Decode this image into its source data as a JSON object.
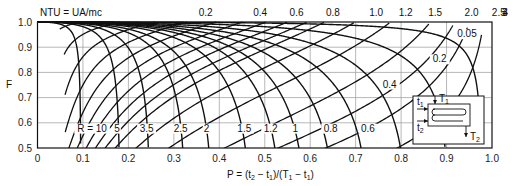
{
  "chart_data": {
    "type": "line",
    "title": "",
    "xlabel": "P = (t2 − t1)/(T1 − t1)",
    "ylabel": "F",
    "xlim": [
      0,
      1.0
    ],
    "ylim": [
      0.5,
      1.0
    ],
    "grid": true,
    "x_ticks": [
      "0",
      "0.1",
      "0.2",
      "0.3",
      "0.4",
      "0.5",
      "0.6",
      "0.7",
      "0.8",
      "0.9",
      "1.0"
    ],
    "y_ticks": [
      "0.5",
      "0.6",
      "0.7",
      "0.8",
      "0.9",
      "1.0"
    ],
    "ntu_family_label": "NTU = UA/mc",
    "ntu_top_labels": [
      {
        "text": "0.2",
        "p": 0.37
      },
      {
        "text": "0.4",
        "p": 0.49
      },
      {
        "text": "0.6",
        "p": 0.57
      },
      {
        "text": "0.8",
        "p": 0.65
      },
      {
        "text": "1.0",
        "p": 0.745
      },
      {
        "text": "1.2",
        "p": 0.81
      },
      {
        "text": "1.5",
        "p": 0.875
      },
      {
        "text": "2.0",
        "p": 0.955
      },
      {
        "text": "2.5",
        "p": 1.015
      },
      {
        "text": "3",
        "p": 1.06
      },
      {
        "text": "4",
        "p": 1.09
      }
    ],
    "ntu_inner_labels": [
      {
        "text": "0.05",
        "p": 0.945,
        "f": 0.94
      },
      {
        "text": "0.2",
        "p": 0.885,
        "f": 0.84
      },
      {
        "text": "0.4",
        "p": 0.775,
        "f": 0.74
      }
    ],
    "r_labels": [
      {
        "text": "R = 10",
        "p": 0.12,
        "f": 0.565
      },
      {
        "text": "5",
        "p": 0.175,
        "f": 0.565
      },
      {
        "text": "3.5",
        "p": 0.24,
        "f": 0.565
      },
      {
        "text": "2.5",
        "p": 0.315,
        "f": 0.565
      },
      {
        "text": "2",
        "p": 0.372,
        "f": 0.565
      },
      {
        "text": "1.5",
        "p": 0.455,
        "f": 0.565
      },
      {
        "text": "1.2",
        "p": 0.513,
        "f": 0.565
      },
      {
        "text": "1",
        "p": 0.567,
        "f": 0.565
      },
      {
        "text": "0.8",
        "p": 0.645,
        "f": 0.565
      },
      {
        "text": "0.6",
        "p": 0.727,
        "f": 0.565
      }
    ],
    "series": [
      {
        "name": "R = 10",
        "R": 10
      },
      {
        "name": "R = 5",
        "R": 5
      },
      {
        "name": "R = 3.5",
        "R": 3.5
      },
      {
        "name": "R = 2.5",
        "R": 2.5
      },
      {
        "name": "R = 2",
        "R": 2
      },
      {
        "name": "R = 1.5",
        "R": 1.5
      },
      {
        "name": "R = 1.2",
        "R": 1.2
      },
      {
        "name": "R = 1",
        "R": 1.0
      },
      {
        "name": "R = 0.8",
        "R": 0.8
      },
      {
        "name": "R = 0.6",
        "R": 0.6
      },
      {
        "name": "R = 0.4",
        "R": 0.4
      },
      {
        "name": "R = 0.2",
        "R": 0.2
      },
      {
        "name": "R = 0.05",
        "R": 0.05
      }
    ],
    "ntu_series": [
      0.1,
      0.2,
      0.3,
      0.4,
      0.5,
      0.6,
      0.7,
      0.8,
      0.9,
      1.0,
      1.2,
      1.5,
      2.0,
      2.5,
      3.0,
      4.0
    ],
    "inset_diagram": {
      "labels": {
        "t1": "t1",
        "t2": "t2",
        "T1": "T1",
        "T2": "T2"
      },
      "description": "1 shell pass, 2 tube passes exchanger schematic"
    }
  }
}
